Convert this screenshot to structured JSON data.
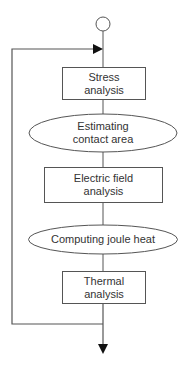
{
  "diagram": {
    "type": "flowchart",
    "colors": {
      "stroke": "#555555",
      "text": "#333333",
      "background": "#ffffff"
    },
    "start": {
      "shape": "circle"
    },
    "nodes": [
      {
        "id": "stress",
        "shape": "rectangle",
        "label": "Stress\nanalysis"
      },
      {
        "id": "contact",
        "shape": "ellipse",
        "label": "Estimating\ncontact area"
      },
      {
        "id": "electric",
        "shape": "rectangle",
        "label": "Electric field\nanalysis"
      },
      {
        "id": "joule",
        "shape": "ellipse",
        "label": "Computing joule heat"
      },
      {
        "id": "thermal",
        "shape": "rectangle",
        "label": "Thermal\nanalysis"
      }
    ],
    "loop": {
      "from": "thermal",
      "to": "stress",
      "description": "feedback loop back to top"
    },
    "end": {
      "shape": "arrow-down"
    }
  }
}
